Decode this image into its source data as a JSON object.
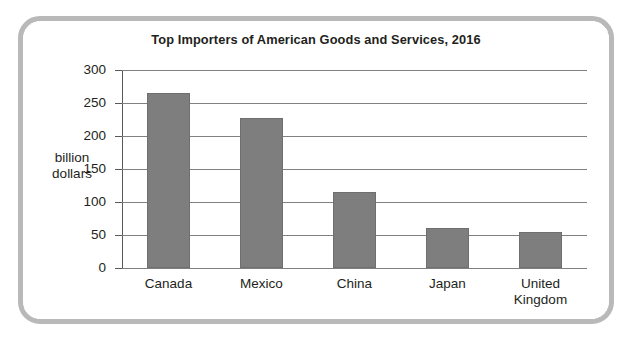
{
  "figure": {
    "frame_color": "#b9b9b9",
    "background": "#ffffff"
  },
  "chart_data": {
    "type": "bar",
    "title": "Top Importers of American Goods and Services, 2016",
    "xlabel": "",
    "ylabel": "billion dollars",
    "ylabel_lines": [
      "billion",
      "dollars"
    ],
    "categories": [
      "Canada",
      "Mexico",
      "China",
      "Japan",
      "United Kingdom"
    ],
    "category_lines": [
      [
        "Canada"
      ],
      [
        "Mexico"
      ],
      [
        "China"
      ],
      [
        "Japan"
      ],
      [
        "United",
        "Kingdom"
      ]
    ],
    "values": [
      265,
      228,
      115,
      60,
      55
    ],
    "ylim": [
      0,
      300
    ],
    "yticks": [
      0,
      50,
      100,
      150,
      200,
      250,
      300
    ],
    "ytick_labels": [
      "0",
      "50",
      "100",
      "150",
      "200",
      "250",
      "300"
    ],
    "grid": true,
    "legend": false,
    "bar_color": "#7e7e7e",
    "gridline_color": "#808080",
    "axis_color": "#58595b",
    "text_color": "#231f20"
  }
}
